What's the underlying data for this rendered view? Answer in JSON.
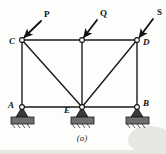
{
  "figure": {
    "caption": "(a)",
    "type": "truss-free-body-diagram"
  },
  "loads": [
    {
      "id": "P",
      "label": "P",
      "applied_at": "C",
      "label_x": 44,
      "label_y": 17
    },
    {
      "id": "Q",
      "label": "Q",
      "applied_at": "middle-top",
      "label_x": 100,
      "label_y": 16
    },
    {
      "id": "S",
      "label": "S",
      "applied_at": "D",
      "label_x": 157,
      "label_y": 15
    }
  ],
  "joints": [
    {
      "id": "C",
      "label": "C",
      "x": 22,
      "y": 40,
      "label_x": 9,
      "label_y": 44,
      "support": false
    },
    {
      "id": "T",
      "label": "",
      "x": 82,
      "y": 40,
      "label_x": 0,
      "label_y": 0,
      "support": false
    },
    {
      "id": "D",
      "label": "D",
      "x": 137,
      "y": 40,
      "label_x": 143,
      "label_y": 45,
      "support": false
    },
    {
      "id": "A",
      "label": "A",
      "x": 22,
      "y": 107,
      "label_x": 8,
      "label_y": 108,
      "support": true
    },
    {
      "id": "E",
      "label": "E",
      "x": 82,
      "y": 107,
      "label_x": 64,
      "label_y": 113,
      "support": true
    },
    {
      "id": "B",
      "label": "B",
      "x": 137,
      "y": 107,
      "label_x": 143,
      "label_y": 106,
      "support": true
    }
  ],
  "members": [
    {
      "from": "C",
      "to": "T",
      "kind": "top-chord"
    },
    {
      "from": "T",
      "to": "D",
      "kind": "top-chord"
    },
    {
      "from": "A",
      "to": "E",
      "kind": "bottom-chord"
    },
    {
      "from": "E",
      "to": "B",
      "kind": "bottom-chord"
    },
    {
      "from": "C",
      "to": "A",
      "kind": "vertical"
    },
    {
      "from": "T",
      "to": "E",
      "kind": "vertical"
    },
    {
      "from": "D",
      "to": "B",
      "kind": "vertical"
    },
    {
      "from": "C",
      "to": "E",
      "kind": "diagonal"
    },
    {
      "from": "D",
      "to": "E",
      "kind": "diagonal"
    }
  ],
  "arrows": [
    {
      "load": "P",
      "x1": 41,
      "y1": 21,
      "x2": 24,
      "y2": 38
    },
    {
      "load": "Q",
      "x1": 97,
      "y1": 20,
      "x2": 84,
      "y2": 38
    },
    {
      "load": "S",
      "x1": 153,
      "y1": 19,
      "x2": 139,
      "y2": 38
    }
  ],
  "supports": [
    {
      "at": "A",
      "x": 22,
      "y": 107
    },
    {
      "at": "E",
      "x": 82,
      "y": 107
    },
    {
      "at": "B",
      "x": 137,
      "y": 107
    }
  ],
  "colors": {
    "background": "#fdfdfb",
    "ink": "#1a1a1a",
    "support_fill": "#6f6f6f",
    "node_fill": "#ffffff"
  }
}
